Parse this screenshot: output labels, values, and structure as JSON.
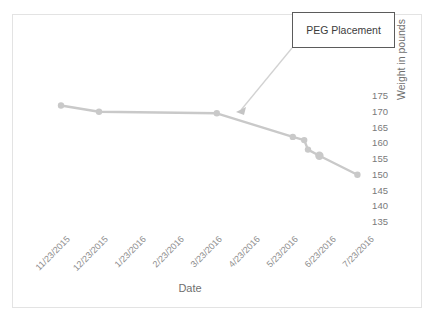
{
  "chart_data": {
    "type": "line",
    "title": "",
    "xlabel": "Date",
    "ylabel": "Weight in pounds",
    "categories": [
      "11/23/2015",
      "12/23/2015",
      "1/23/2016",
      "2/23/2016",
      "3/23/2016",
      "4/23/2016",
      "5/23/2016",
      "6/23/2016",
      "7/23/2016"
    ],
    "yticks": [
      175,
      170,
      165,
      160,
      155,
      150,
      145,
      140,
      135
    ],
    "ylim": [
      133,
      177
    ],
    "grid": false,
    "legend": null,
    "series": [
      {
        "name": "Weight",
        "color": "#c9c9c9",
        "points": [
          {
            "x_label": "11/23/2015",
            "x_value": 0.0,
            "y": 172.0
          },
          {
            "x_label": "12/23/2015",
            "x_value": 1.0,
            "y": 170.0
          },
          {
            "x_label": "3/23/2016",
            "x_value": 4.1,
            "y": 169.5
          },
          {
            "x_label": "5/23/2016",
            "x_value": 6.1,
            "y": 162.0
          },
          {
            "x_label": "5/23/2016",
            "x_value": 6.4,
            "y": 161.0
          },
          {
            "x_label": "6/23/2016",
            "x_value": 6.5,
            "y": 158.0
          },
          {
            "x_label": "6/23/2016",
            "x_value": 6.8,
            "y": 156.0
          },
          {
            "x_label": "7/23/2016",
            "x_value": 7.8,
            "y": 150.0
          }
        ]
      }
    ],
    "annotations": [
      {
        "text": "PEG Placement",
        "points_to_x_label": "4/23/2016",
        "points_to_y": 169.0
      }
    ]
  },
  "axis": {
    "ylabel_text": "Weight in pounds",
    "xlabel_text": "Date"
  },
  "annotation": {
    "peg_label": "PEG Placement"
  }
}
